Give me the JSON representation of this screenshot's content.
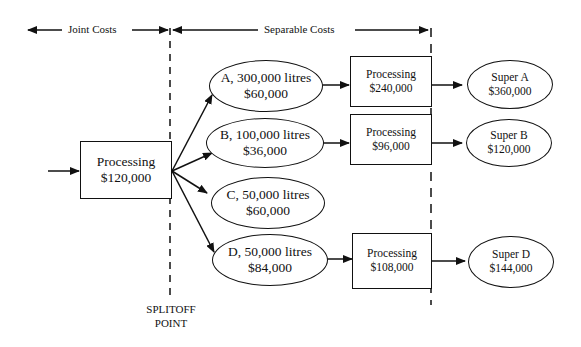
{
  "header": {
    "joint_costs_label": "Joint Costs",
    "separable_costs_label": "Separable Costs"
  },
  "joint_process": {
    "label": "Processing",
    "cost": "$120,000"
  },
  "splitoff": {
    "line1": "SPLITOFF",
    "line2": "POINT"
  },
  "products": [
    {
      "id": "A",
      "label": "A, 300,000 litres",
      "value": "$60,000"
    },
    {
      "id": "B",
      "label": "B, 100,000 litres",
      "value": "$36,000"
    },
    {
      "id": "C",
      "label": "C, 50,000 litres",
      "value": "$60,000"
    },
    {
      "id": "D",
      "label": "D, 50,000 litres",
      "value": "$84,000"
    }
  ],
  "further_processing": [
    {
      "for": "A",
      "label": "Processing",
      "cost": "$240,000"
    },
    {
      "for": "B",
      "label": "Processing",
      "cost": "$96,000"
    },
    {
      "for": "D",
      "label": "Processing",
      "cost": "$108,000"
    }
  ],
  "final_products": [
    {
      "for": "A",
      "label": "Super A",
      "value": "$360,000"
    },
    {
      "for": "B",
      "label": "Super B",
      "value": "$120,000"
    },
    {
      "for": "D",
      "label": "Super D",
      "value": "$144,000"
    }
  ]
}
